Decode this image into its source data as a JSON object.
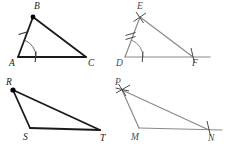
{
  "figure": {
    "width": 230,
    "height": 150,
    "background": "#ffffff",
    "stroke_dark": "#1a1a1a",
    "stroke_gray": "#8a8a8a",
    "stroke_mid": "#5a5a5a",
    "label_color_dark": "#1a1a1a",
    "label_color_gray": "#4a4a4a"
  },
  "panels": [
    {
      "id": "triangle-abc",
      "position": "top-left",
      "style": "dark",
      "vertices": [
        {
          "name": "A",
          "label": "A",
          "x": 18,
          "y": 57,
          "label_x": 9,
          "label_y": 66,
          "marker": "none"
        },
        {
          "name": "B",
          "label": "B",
          "x": 33,
          "y": 17,
          "label_x": 34,
          "label_y": 9,
          "marker": "dot"
        },
        {
          "name": "C",
          "label": "C",
          "x": 86,
          "y": 57,
          "label_x": 88,
          "label_y": 66,
          "marker": "none"
        }
      ],
      "edges": [
        {
          "from": "A",
          "to": "B"
        },
        {
          "from": "B",
          "to": "C"
        },
        {
          "from": "A",
          "to": "C"
        }
      ],
      "arcs": [
        {
          "at": "A",
          "radius": 18,
          "start_deg": 270,
          "end_deg": 340,
          "ticks": 1
        }
      ],
      "tick_marks": [
        {
          "on": "AB",
          "count": 1
        },
        {
          "on": "AC",
          "count": 1
        }
      ]
    },
    {
      "id": "triangle-def",
      "position": "top-right",
      "style": "gray",
      "vertices": [
        {
          "name": "D",
          "label": "D",
          "x": 125,
          "y": 57,
          "label_x": 116,
          "label_y": 66,
          "marker": "none"
        },
        {
          "name": "E",
          "label": "E",
          "x": 140,
          "y": 17,
          "label_x": 138,
          "label_y": 9,
          "marker": "cross"
        },
        {
          "name": "F",
          "label": "F",
          "x": 193,
          "y": 57,
          "label_x": 193,
          "label_y": 66,
          "marker": "tick"
        }
      ],
      "edges": [
        {
          "from": "D",
          "to": "E"
        },
        {
          "from": "E",
          "to": "F"
        },
        {
          "from": "D",
          "to": "F",
          "extended": true,
          "extend_to_x": 210
        }
      ],
      "arcs": [
        {
          "at": "D",
          "radius": 18,
          "start_deg": 270,
          "end_deg": 340,
          "ticks": 2
        }
      ],
      "tick_marks": [
        {
          "on": "DE",
          "count": 2
        },
        {
          "on": "DF",
          "count": 1
        }
      ]
    },
    {
      "id": "triangle-rst",
      "position": "bottom-left",
      "style": "dark",
      "vertices": [
        {
          "name": "R",
          "label": "R",
          "x": 13,
          "y": 90,
          "label_x": 7,
          "label_y": 84,
          "marker": "dot"
        },
        {
          "name": "S",
          "label": "S",
          "x": 30,
          "y": 128,
          "label_x": 23,
          "label_y": 139,
          "marker": "none"
        },
        {
          "name": "T",
          "label": "T",
          "x": 100,
          "y": 130,
          "label_x": 101,
          "label_y": 140,
          "marker": "none"
        }
      ],
      "edges": [
        {
          "from": "R",
          "to": "S"
        },
        {
          "from": "R",
          "to": "T"
        },
        {
          "from": "S",
          "to": "T"
        }
      ],
      "arcs": [],
      "tick_marks": []
    },
    {
      "id": "triangle-pmn",
      "position": "bottom-right",
      "style": "gray",
      "vertices": [
        {
          "name": "P",
          "label": "P",
          "x": 122,
          "y": 90,
          "label_x": 116,
          "label_y": 84,
          "marker": "cross"
        },
        {
          "name": "M",
          "label": "M",
          "x": 139,
          "y": 128,
          "label_x": 131,
          "label_y": 139,
          "marker": "none"
        },
        {
          "name": "N",
          "label": "N",
          "x": 209,
          "y": 130,
          "label_x": 209,
          "label_y": 140,
          "marker": "tick"
        }
      ],
      "edges": [
        {
          "from": "P",
          "to": "M"
        },
        {
          "from": "P",
          "to": "N"
        },
        {
          "from": "M",
          "to": "N",
          "extended": true,
          "extend_to_x": 222
        }
      ],
      "arcs": [],
      "tick_marks": []
    }
  ],
  "labels": {
    "A": "A",
    "B": "B",
    "C": "C",
    "D": "D",
    "E": "E",
    "F": "F",
    "R": "R",
    "S": "S",
    "T": "T",
    "P": "P",
    "M": "M",
    "N": "N"
  }
}
